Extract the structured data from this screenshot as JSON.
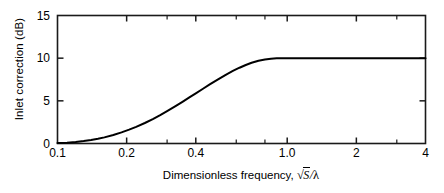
{
  "chart_data": {
    "type": "line",
    "title": "",
    "xlabel": "Dimensionless frequency,",
    "xlabel_math": {
      "radical": "√",
      "radicand": "S",
      "divider": "/",
      "denominator": "λ"
    },
    "ylabel": "Inlet correction (dB)",
    "xscale": "log",
    "yscale": "linear",
    "xlim": [
      0.1,
      4
    ],
    "ylim": [
      0,
      15
    ],
    "grid": false,
    "legend": null,
    "xticks": [
      {
        "value": 0.1,
        "label": "0.1",
        "major": true
      },
      {
        "value": 0.2,
        "label": "0.2",
        "major": true
      },
      {
        "value": 0.3,
        "label": "",
        "major": false
      },
      {
        "value": 0.4,
        "label": "0.4",
        "major": true
      },
      {
        "value": 0.6,
        "label": "",
        "major": false
      },
      {
        "value": 0.8,
        "label": "",
        "major": false
      },
      {
        "value": 1.0,
        "label": "1.0",
        "major": true
      },
      {
        "value": 2.0,
        "label": "2",
        "major": true
      },
      {
        "value": 3.0,
        "label": "",
        "major": false
      },
      {
        "value": 4.0,
        "label": "4",
        "major": true
      }
    ],
    "yticks": [
      {
        "value": 0,
        "label": "0"
      },
      {
        "value": 5,
        "label": "5"
      },
      {
        "value": 10,
        "label": "10"
      },
      {
        "value": 15,
        "label": "15"
      }
    ],
    "series": [
      {
        "name": "Inlet correction",
        "color": "#000000",
        "linewidth": 2,
        "x": [
          0.1,
          0.11,
          0.12,
          0.13,
          0.14,
          0.15,
          0.16,
          0.175,
          0.19,
          0.205,
          0.22,
          0.24,
          0.26,
          0.28,
          0.3,
          0.325,
          0.35,
          0.375,
          0.4,
          0.43,
          0.46,
          0.5,
          0.54,
          0.58,
          0.62,
          0.66,
          0.7,
          0.75,
          0.8,
          0.85,
          0.9,
          0.95,
          1.0,
          1.2,
          1.5,
          2.0,
          2.5,
          3.0,
          3.5,
          4.0
        ],
        "y": [
          0.05,
          0.1,
          0.18,
          0.28,
          0.4,
          0.55,
          0.72,
          1.0,
          1.3,
          1.62,
          1.95,
          2.4,
          2.86,
          3.32,
          3.78,
          4.34,
          4.88,
          5.4,
          5.88,
          6.42,
          6.92,
          7.52,
          8.05,
          8.5,
          8.88,
          9.2,
          9.46,
          9.7,
          9.85,
          9.94,
          9.98,
          10.0,
          10.0,
          10.0,
          10.0,
          10.0,
          10.0,
          10.0,
          10.0,
          10.0
        ]
      }
    ],
    "annotations": [],
    "axis_color": "#1a1a1a",
    "background": "#ffffff"
  }
}
